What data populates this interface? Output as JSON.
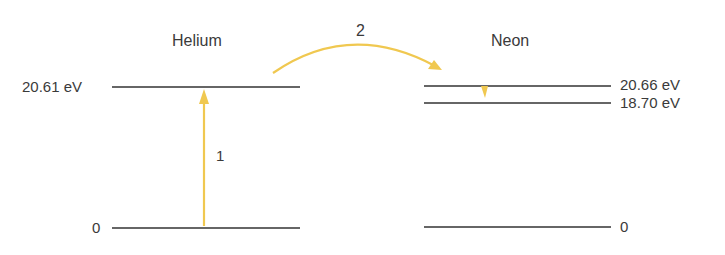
{
  "diagram": {
    "type": "energy-level-diagram",
    "colors": {
      "level_line": "#333333",
      "transition": "#f0c850",
      "text": "#3a3a3a"
    },
    "helium": {
      "title": "Helium",
      "levels": [
        {
          "label": "20.61 eV",
          "energy_ev": 20.61
        },
        {
          "label": "0",
          "energy_ev": 0
        }
      ]
    },
    "neon": {
      "title": "Neon",
      "levels": [
        {
          "label": "20.66 eV",
          "energy_ev": 20.66
        },
        {
          "label": "18.70 eV",
          "energy_ev": 18.7
        },
        {
          "label": "0",
          "energy_ev": 0
        }
      ]
    },
    "transitions": [
      {
        "label": "1",
        "description": "Helium excitation 0 to 20.61 eV"
      },
      {
        "label": "2",
        "description": "Energy transfer Helium 20.61 eV to Neon 20.66 eV"
      }
    ]
  }
}
